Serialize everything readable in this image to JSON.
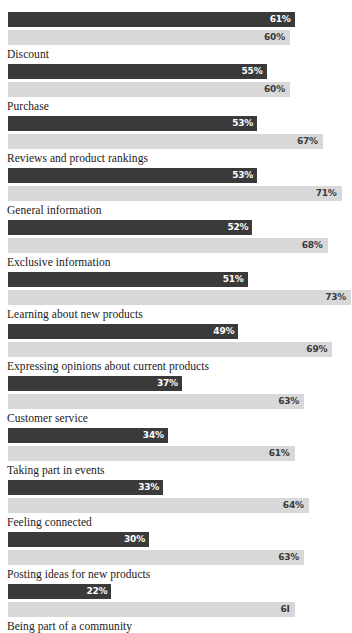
{
  "chart_data": {
    "type": "bar",
    "title": "",
    "subtitle": "",
    "xlabel": "",
    "ylabel": "",
    "orientation": "horizontal",
    "grid": false,
    "legend_position": "none",
    "xlim": [
      0,
      75
    ],
    "value_suffix": "%",
    "colors": {
      "series_dark": "#3a3a3a",
      "series_light": "#d8d8d8",
      "label_text": "#1a1a1a",
      "value_on_dark": "#ffffff",
      "value_on_light": "#3a3a3a",
      "background": "#ffffff"
    },
    "categories": [
      "Discount",
      "Purchase",
      "Reviews and product rankings",
      "General information",
      "Exclusive information",
      "Learning about new products",
      "Expressing opinions about current products",
      "Customer service",
      "Taking part in events",
      "Feeling connected",
      "Posting ideas for new products",
      "Being part of a community"
    ],
    "series": [
      {
        "name": "dark",
        "values": [
          61,
          55,
          53,
          53,
          52,
          51,
          49,
          37,
          34,
          33,
          30,
          22
        ]
      },
      {
        "name": "light",
        "values": [
          60,
          60,
          67,
          71,
          68,
          73,
          69,
          63,
          61,
          64,
          63,
          61
        ]
      }
    ],
    "value_labels": {
      "dark": [
        "61%",
        "55%",
        "53%",
        "53%",
        "52%",
        "51%",
        "49%",
        "37%",
        "34%",
        "33%",
        "30%",
        "22%"
      ],
      "light": [
        "60%",
        "60%",
        "67%",
        "71%",
        "68%",
        "73%",
        "69%",
        "63%",
        "61%",
        "64%",
        "63%",
        "6I"
      ]
    }
  },
  "groups": [
    {
      "label": "Discount",
      "dark_value": 61,
      "dark_label": "61%",
      "light_value": 60,
      "light_label": "60%"
    },
    {
      "label": "Purchase",
      "dark_value": 55,
      "dark_label": "55%",
      "light_value": 60,
      "light_label": "60%"
    },
    {
      "label": "Reviews and product rankings",
      "dark_value": 53,
      "dark_label": "53%",
      "light_value": 67,
      "light_label": "67%"
    },
    {
      "label": "General information",
      "dark_value": 53,
      "dark_label": "53%",
      "light_value": 71,
      "light_label": "71%"
    },
    {
      "label": "Exclusive information",
      "dark_value": 52,
      "dark_label": "52%",
      "light_value": 68,
      "light_label": "68%"
    },
    {
      "label": "Learning about new products",
      "dark_value": 51,
      "dark_label": "51%",
      "light_value": 73,
      "light_label": "73%"
    },
    {
      "label": "Expressing opinions about current products",
      "dark_value": 49,
      "dark_label": "49%",
      "light_value": 69,
      "light_label": "69%"
    },
    {
      "label": "Customer service",
      "dark_value": 37,
      "dark_label": "37%",
      "light_value": 63,
      "light_label": "63%"
    },
    {
      "label": "Taking part in events",
      "dark_value": 34,
      "dark_label": "34%",
      "light_value": 61,
      "light_label": "61%"
    },
    {
      "label": "Feeling connected",
      "dark_value": 33,
      "dark_label": "33%",
      "light_value": 64,
      "light_label": "64%"
    },
    {
      "label": "Posting ideas for new products",
      "dark_value": 30,
      "dark_label": "30%",
      "light_value": 63,
      "light_label": "63%"
    },
    {
      "label": "Being part of a community",
      "dark_value": 22,
      "dark_label": "22%",
      "light_value": 61,
      "light_label": "6I"
    }
  ]
}
